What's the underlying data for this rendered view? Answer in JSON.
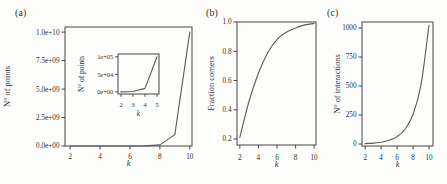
{
  "figure": {
    "background": "#fdfdfb",
    "frame_color": "#454545",
    "curve_color": "#5a5a5a",
    "text_color": "#2f2f2f"
  },
  "panel_letters": [
    "(a)",
    "(b)",
    "(c)"
  ],
  "chart_data": [
    {
      "id": "a",
      "panel": "(a)",
      "type": "line",
      "title": "",
      "x": [
        2,
        3,
        4,
        5,
        6,
        7,
        8,
        9,
        10
      ],
      "y": [
        100,
        1000,
        10000,
        100000,
        1000000,
        10000000,
        100000000,
        1000000000,
        10000000000
      ],
      "xlabel": "k",
      "ylabel": "N° of points",
      "xlim": [
        1.65,
        10.15
      ],
      "ylim": [
        0,
        10450000000
      ],
      "xtick_values": [
        2,
        4,
        6,
        8,
        10
      ],
      "xtick_labels": [
        "2",
        "4",
        "6",
        "8",
        "10"
      ],
      "ytick_values": [
        0,
        2500000000,
        5000000000,
        7500000000,
        10000000000
      ],
      "ytick_labels": [
        "0.0e+00",
        "2.5e+09",
        "5.0e+09",
        "7.5e+09",
        "1.0e+10"
      ],
      "smooth": false,
      "grid": false,
      "legend": false
    },
    {
      "id": "a_inset",
      "panel": "(a) inset",
      "type": "line",
      "title": "",
      "x": [
        2,
        3,
        4,
        5
      ],
      "y": [
        100,
        1000,
        10000,
        100000
      ],
      "xlabel": "k",
      "ylabel": "N° of points",
      "xlim": [
        1.75,
        5.17
      ],
      "ylim": [
        -6000,
        108000
      ],
      "xtick_values": [
        2,
        3,
        4,
        5
      ],
      "xtick_labels": [
        "2",
        "3",
        "4",
        "5"
      ],
      "ytick_values": [
        0,
        50000,
        100000
      ],
      "ytick_labels": [
        "0e+00",
        "5e+04",
        "1e+05"
      ],
      "smooth": false,
      "grid": false,
      "legend": false
    },
    {
      "id": "b",
      "panel": "(b)",
      "type": "line",
      "title": "",
      "x": [
        2,
        3,
        4,
        5,
        6,
        7,
        8,
        9,
        10
      ],
      "y": [
        0.21,
        0.46,
        0.65,
        0.79,
        0.88,
        0.93,
        0.96,
        0.98,
        0.99
      ],
      "xlabel": "k",
      "ylabel": "Fraction corners",
      "xlim": [
        1.7,
        10.2
      ],
      "ylim": [
        0.159,
        1.0
      ],
      "xtick_values": [
        2,
        4,
        6,
        8,
        10
      ],
      "xtick_labels": [
        "2",
        "4",
        "6",
        "8",
        "10"
      ],
      "ytick_values": [
        0.2,
        0.4,
        0.6,
        0.8,
        1.0
      ],
      "ytick_labels": [
        "0.2",
        "0.4",
        "0.6",
        "0.8",
        "1.0"
      ],
      "smooth": true,
      "grid": false,
      "legend": false
    },
    {
      "id": "c",
      "panel": "(c)",
      "type": "line",
      "title": "",
      "x": [
        2,
        3,
        4,
        5,
        6,
        7,
        8,
        9,
        10
      ],
      "y": [
        4,
        8,
        16,
        32,
        64,
        128,
        256,
        512,
        1024
      ],
      "xlabel": "k",
      "ylabel": "N° of interactions",
      "xlim": [
        1.6,
        10.5
      ],
      "ylim": [
        -17,
        1052
      ],
      "xtick_values": [
        2,
        4,
        6,
        8,
        10
      ],
      "xtick_labels": [
        "2",
        "4",
        "6",
        "8",
        "10"
      ],
      "ytick_values": [
        0,
        250,
        500,
        750,
        1000
      ],
      "ytick_labels": [
        "0",
        "250",
        "500",
        "750",
        "1000"
      ],
      "smooth": true,
      "grid": false,
      "legend": false
    }
  ]
}
